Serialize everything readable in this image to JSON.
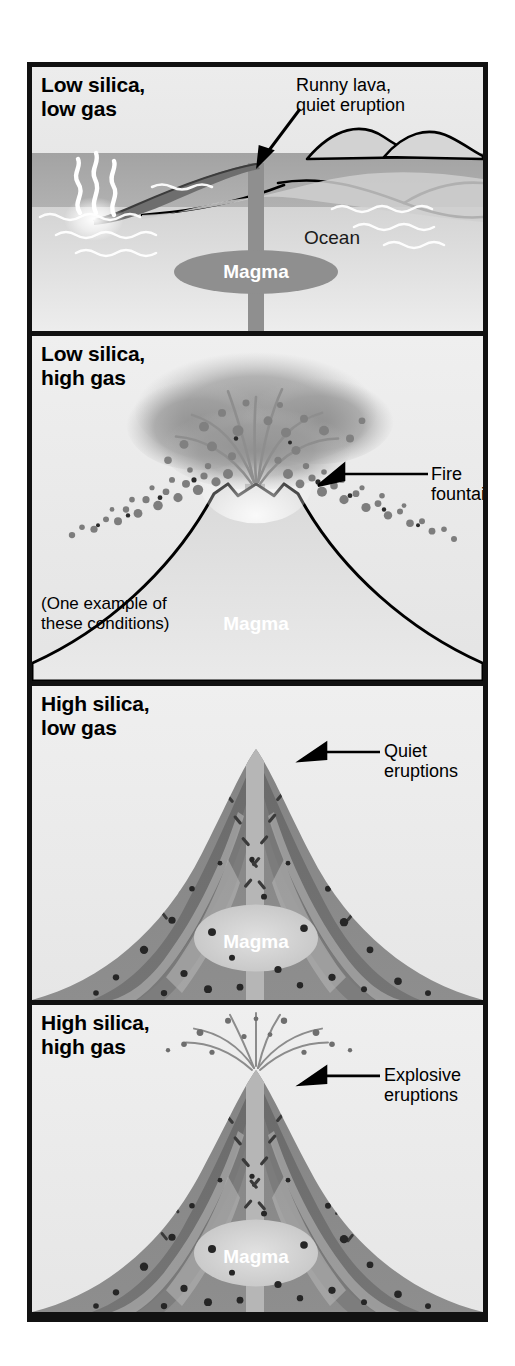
{
  "figure": {
    "kind": "volcanic-eruption-style-diagram",
    "panel_count": 4,
    "colors": {
      "frame": "#111111",
      "panel_background": "#e9e9e9",
      "magma": "#8f8f8f",
      "magma_light": "#d8d8d8",
      "rock_dark": "#6f6f6f",
      "rock_mid": "#8a8a8a",
      "water": "#a6a6a6",
      "ash_cloud": "#9a9a9a",
      "outline": "#000000",
      "label_text": "#000000",
      "magma_label_text": "#ffffff"
    }
  },
  "panels": [
    {
      "id": "low-silica-low-gas",
      "title": "Low silica,\nlow gas",
      "callout": "Runny lava,\nquiet eruption",
      "labels": {
        "ocean": "Ocean",
        "magma": "Magma"
      },
      "note": ""
    },
    {
      "id": "low-silica-high-gas",
      "title": "Low silica,\nhigh gas",
      "callout": "Fire fountain",
      "labels": {
        "magma": "Magma"
      },
      "note": "(One example of\nthese conditions)"
    },
    {
      "id": "high-silica-low-gas",
      "title": "High silica,\nlow gas",
      "callout": "Quiet\neruptions",
      "labels": {
        "magma": "Magma"
      },
      "note": ""
    },
    {
      "id": "high-silica-high-gas",
      "title": "High silica,\nhigh gas",
      "callout": "Explosive\neruptions",
      "labels": {
        "magma": "Magma"
      },
      "note": ""
    }
  ]
}
